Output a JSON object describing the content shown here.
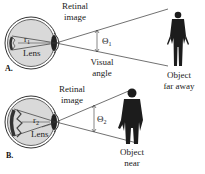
{
  "figure": {
    "panels": [
      {
        "id": "A",
        "letter": "A.",
        "retinal_image_label_line1": "Retinal",
        "retinal_image_label_line2": "image",
        "radius_label": "r",
        "radius_sub": "1",
        "lens_label": "Lens",
        "angle_symbol": "Θ",
        "angle_sub": "1",
        "visual_angle_line1": "Visual",
        "visual_angle_line2": "angle",
        "object_line1": "Object",
        "object_line2": "far away"
      },
      {
        "id": "B",
        "letter": "B.",
        "retinal_image_label_line1": "Retinal",
        "retinal_image_label_line2": "image",
        "radius_label": "r",
        "radius_sub": "2",
        "lens_label": "Lens",
        "angle_symbol": "Θ",
        "angle_sub": "2",
        "object_line1": "Object",
        "object_line2": "near"
      }
    ],
    "colors": {
      "line": "#333333",
      "eye_fill": "#d8d8d8",
      "silhouette": "#1c1c1c",
      "background": "#ffffff"
    }
  }
}
